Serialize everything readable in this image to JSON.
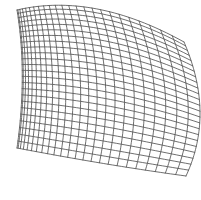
{
  "figure": {
    "width": 201,
    "height": 200,
    "background_color": "#ffffff",
    "line_color": "#4a4a4a",
    "line_width": 0.8,
    "render_type": "wireframe"
  },
  "chart_data": {
    "type": "mesh",
    "rows": 24,
    "cols": 24,
    "grid": true,
    "legend": "none",
    "corners": {
      "top_left": [
        17,
        10
      ],
      "top_right": [
        184,
        42
      ],
      "bottom_right": [
        186,
        176
      ],
      "bottom_left": [
        17,
        148
      ]
    },
    "edge_curvature": {
      "top": "convex-up",
      "right": "convex-right",
      "bottom": "convex-down",
      "left": "convex-right"
    },
    "surface_warp": {
      "u_bulge_x": 13,
      "u_bulge_y": -17,
      "v_bulge_x": 15,
      "v_bulge_y": 8,
      "perspective_compress_u": 0.62,
      "perspective_compress_v": 0.88
    },
    "xlabel": "",
    "ylabel": "",
    "xlim": [
      0,
      201
    ],
    "ylim": [
      0,
      200
    ]
  }
}
